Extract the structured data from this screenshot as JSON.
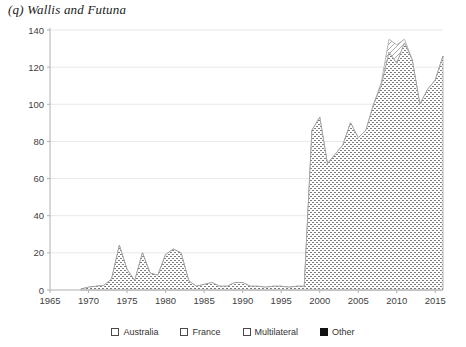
{
  "chart": {
    "title": "(q) Wallis and Futuna",
    "type": "area"
  },
  "legend": {
    "position": "bottom",
    "items": [
      {
        "label": "Australia",
        "swatch": "hatch-dot-sparse",
        "color": "#ffffff"
      },
      {
        "label": "France",
        "swatch": "hatch-dot-dense",
        "color": "#ffffff"
      },
      {
        "label": "Multilateral",
        "swatch": "hatch-diagonal",
        "color": "#ffffff"
      },
      {
        "label": "Other",
        "swatch": "solid-black",
        "color": "#111111"
      }
    ]
  },
  "axes": {
    "x": {
      "label": "",
      "min": 1965,
      "max": 2016,
      "ticks": [
        1965,
        1970,
        1975,
        1980,
        1985,
        1990,
        1995,
        2000,
        2005,
        2010,
        2015
      ],
      "tick_labels": [
        "1965",
        "1970",
        "1975",
        "1980",
        "1985",
        "1990",
        "1995",
        "2000",
        "2005",
        "2010",
        "2015"
      ]
    },
    "y": {
      "label": "",
      "min": 0,
      "max": 140,
      "ticks": [
        0,
        20,
        40,
        60,
        80,
        100,
        120,
        140
      ],
      "tick_labels": [
        "0",
        "20",
        "40",
        "60",
        "80",
        "100",
        "120",
        "140"
      ]
    },
    "grid": "horizontal-light"
  },
  "chart_data": {
    "type": "area",
    "title": "(q) Wallis and Futuna",
    "xlabel": "",
    "ylabel": "",
    "xlim": [
      1965,
      2016
    ],
    "ylim": [
      0,
      140
    ],
    "grid": true,
    "legend_position": "bottom",
    "stacked": true,
    "x": [
      1969,
      1970,
      1971,
      1972,
      1973,
      1974,
      1975,
      1976,
      1977,
      1978,
      1979,
      1980,
      1981,
      1982,
      1983,
      1984,
      1985,
      1986,
      1987,
      1988,
      1989,
      1990,
      1991,
      1992,
      1993,
      1994,
      1995,
      1996,
      1997,
      1998,
      1999,
      2000,
      2001,
      2002,
      2003,
      2004,
      2005,
      2006,
      2007,
      2008,
      2009,
      2010,
      2011,
      2012,
      2013,
      2014,
      2015,
      2016
    ],
    "series": [
      {
        "name": "France",
        "swatch": "hatch-dot-dense",
        "values": [
          0.5,
          1.5,
          2.0,
          2.5,
          6.0,
          24.0,
          11.0,
          5.0,
          20.0,
          9.0,
          8.0,
          19.0,
          22.0,
          20.0,
          5.0,
          2.0,
          3.0,
          4.0,
          2.0,
          2.0,
          4.0,
          4.0,
          2.0,
          2.0,
          1.5,
          2.0,
          2.0,
          1.5,
          2.0,
          2.0,
          86.0,
          93.0,
          68.0,
          73.0,
          78.0,
          90.0,
          82.0,
          86.0,
          100.0,
          110.0,
          128.0,
          122.0,
          133.0,
          124.0,
          100.0,
          108.0,
          113.0,
          126.0
        ]
      },
      {
        "name": "Multilateral",
        "swatch": "hatch-diagonal",
        "values": [
          0,
          0,
          0,
          0,
          0,
          0,
          0,
          0,
          0,
          0,
          0,
          0,
          0,
          0,
          0,
          0,
          0,
          0,
          0,
          0,
          0,
          0,
          0,
          0,
          0,
          0,
          0,
          0,
          0,
          0,
          0,
          0,
          0,
          0,
          0,
          0,
          0,
          0,
          0,
          2.0,
          7.0,
          10.0,
          2.0,
          0,
          0,
          0,
          0,
          0
        ]
      },
      {
        "name": "Australia",
        "swatch": "hatch-dot-sparse",
        "values": [
          0,
          0,
          0,
          0,
          0,
          0,
          0,
          0,
          0,
          0,
          0,
          0,
          0,
          0,
          0,
          0,
          0,
          0,
          0,
          0,
          0,
          0,
          0,
          0,
          0,
          0,
          0,
          0,
          0,
          0,
          0,
          0,
          0,
          0,
          0,
          0,
          0,
          0,
          0,
          0,
          0,
          0,
          0,
          0,
          0,
          0,
          0,
          0
        ]
      },
      {
        "name": "Other",
        "swatch": "solid-black",
        "values": [
          0,
          0,
          0,
          0,
          0,
          0,
          0,
          0,
          0,
          0,
          0,
          0,
          0,
          0,
          0,
          0,
          0,
          0,
          0,
          0,
          0,
          0,
          0,
          0,
          0,
          0,
          0,
          0,
          0,
          0,
          0,
          0,
          0,
          0,
          0,
          0,
          0,
          0,
          0,
          0,
          0,
          0,
          0,
          0,
          0,
          0,
          0,
          0
        ]
      }
    ]
  }
}
